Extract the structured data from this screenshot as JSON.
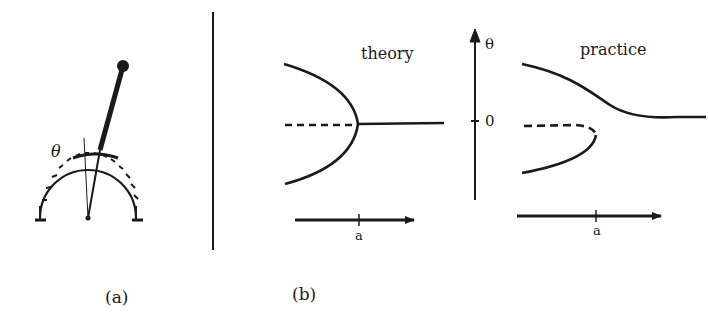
{
  "panel_a": {
    "label": "(a)",
    "angle_symbol": "θ"
  },
  "panel_b": {
    "label": "(b)",
    "theory": {
      "title": "theory",
      "x_axis_label": "a"
    },
    "theta_axis": {
      "label": "θ",
      "zero_label": "0"
    },
    "practice": {
      "title": "practice",
      "x_axis_label": "a"
    }
  },
  "colors": {
    "ink": "#1a1a1a",
    "background": "#ffffff"
  }
}
